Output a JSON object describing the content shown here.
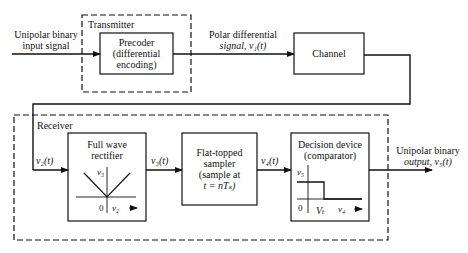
{
  "diagram": {
    "input_label": [
      "Unipolar binary",
      "input signal"
    ],
    "transmitter": {
      "group_label": "Transmitter",
      "precoder_label": [
        "Precoder",
        "(differential",
        "encoding)"
      ]
    },
    "polar_label": [
      "Polar differential",
      "signal, v₁(t)"
    ],
    "channel_label": "Channel",
    "receiver": {
      "group_label": "Receiver",
      "v2_label": "v₂(t)",
      "rectifier_label": [
        "Full wave",
        "rectifier"
      ],
      "rectifier_plot": {
        "y_axis": "v₃",
        "x_axis": "v₂",
        "origin": "0"
      },
      "v3_label": "v₃(t)",
      "sampler_label": [
        "Flat-topped",
        "sampler",
        "(sample at",
        "t = nTₛ)"
      ],
      "v4_label": "v₄(t)",
      "decision_label": [
        "Decision device",
        "(comparator)"
      ],
      "decision_plot": {
        "y_axis": "v₅",
        "x_axis": "v₄",
        "origin": "0",
        "threshold": "Vₜ"
      }
    },
    "output_label": [
      "Unipolar binary",
      "output, v₅(t)"
    ],
    "colors": {
      "line": "#111111",
      "background": "#ffffff"
    }
  }
}
